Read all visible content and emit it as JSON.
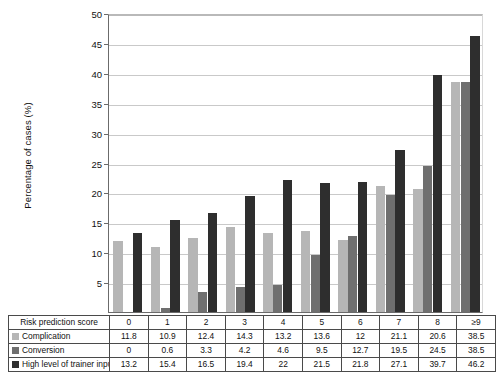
{
  "chart_data": {
    "type": "bar",
    "title": "",
    "xlabel": "Risk prediction score",
    "ylabel": "Percentage of cases (%)",
    "categories": [
      "0",
      "1",
      "2",
      "3",
      "4",
      "5",
      "6",
      "7",
      "8",
      "≥9"
    ],
    "ylim": [
      0,
      50
    ],
    "yticks": [
      0,
      5,
      10,
      15,
      20,
      25,
      30,
      35,
      40,
      45,
      50
    ],
    "ytick_labels": [
      "",
      "5",
      "10",
      "15",
      "20",
      "25",
      "30",
      "35",
      "40",
      "45",
      "50"
    ],
    "grid": "horizontal",
    "legend_position": "table-row-labels",
    "series": [
      {
        "name": "Complication",
        "color": "#b6b6b6",
        "values": [
          11.8,
          10.9,
          12.4,
          14.3,
          13.2,
          13.6,
          12,
          21.1,
          20.6,
          38.5
        ]
      },
      {
        "name": "Conversion",
        "color": "#6f6f6f",
        "values": [
          0,
          0.6,
          3.3,
          4.2,
          4.6,
          9.5,
          12.7,
          19.5,
          24.5,
          38.5
        ]
      },
      {
        "name": "High level of trainer input",
        "color": "#2e2e2e",
        "values": [
          13.2,
          15.4,
          16.5,
          19.4,
          22,
          21.5,
          21.8,
          27.1,
          39.7,
          46.2
        ]
      }
    ]
  },
  "axis": {
    "y_title": "Percentage of cases (%)"
  },
  "table": {
    "header_label": "Risk prediction score",
    "columns": [
      "0",
      "1",
      "2",
      "3",
      "4",
      "5",
      "6",
      "7",
      "8",
      "≥9"
    ],
    "rows": [
      {
        "label": "Complication",
        "color_key": "c0",
        "values": [
          "11.8",
          "10.9",
          "12.4",
          "14.3",
          "13.2",
          "13.6",
          "12",
          "21.1",
          "20.6",
          "38.5"
        ]
      },
      {
        "label": "Conversion",
        "color_key": "c1",
        "values": [
          "0",
          "0.6",
          "3.3",
          "4.2",
          "4.6",
          "9.5",
          "12.7",
          "19.5",
          "24.5",
          "38.5"
        ]
      },
      {
        "label": "High level of trainer input",
        "color_key": "c2",
        "values": [
          "13.2",
          "15.4",
          "16.5",
          "19.4",
          "22",
          "21.5",
          "21.8",
          "27.1",
          "39.7",
          "46.2"
        ]
      }
    ]
  },
  "colors": {
    "series_1": "#b6b6b6",
    "series_2": "#6f6f6f",
    "series_3": "#2e2e2e",
    "grid": "#c9c9c9",
    "axis": "#6b6b6b",
    "table_border": "#4a4a4a",
    "background": "#ffffff"
  }
}
